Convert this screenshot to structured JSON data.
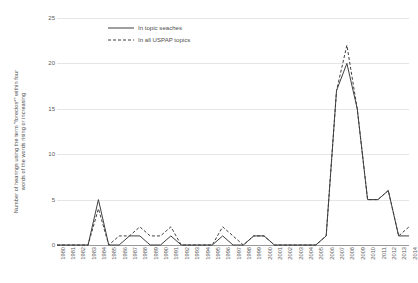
{
  "chart_data": {
    "type": "line",
    "title": "",
    "subtitle": "",
    "xlabel": "",
    "ylabel": "Number of hearings using the term \"foreclos*\" within four words of the words rising or increasing",
    "ylabel_line1": "Number of hearings using the term \"foreclos*\" within four",
    "ylabel_line2": "words of the words rising or increasing",
    "grid": true,
    "legend_position": "top-left-inside",
    "xlim": [
      1980,
      2014
    ],
    "ylim": [
      0,
      25
    ],
    "yticks": [
      0,
      5,
      10,
      15,
      20,
      25
    ],
    "ytick_labels": [
      "0",
      "5",
      "10",
      "15",
      "20",
      "25"
    ],
    "categories": [
      "1980",
      "1981",
      "1982",
      "1983",
      "1984",
      "1985",
      "1986",
      "1987",
      "1988",
      "1989",
      "1990",
      "1991",
      "1992",
      "1993",
      "1994",
      "1995",
      "1996",
      "1997",
      "1998",
      "1999",
      "2000",
      "2001",
      "2002",
      "2003",
      "2004",
      "2005",
      "2006",
      "2007",
      "2008",
      "2009",
      "2010",
      "2011",
      "2012",
      "2013",
      "2014"
    ],
    "series": [
      {
        "name": "In topic seaches",
        "style": "solid",
        "values": [
          0,
          0,
          0,
          0,
          5,
          0,
          0,
          1,
          1,
          0,
          0,
          1,
          0,
          0,
          0,
          0,
          1,
          0,
          0,
          1,
          1,
          0,
          0,
          0,
          0,
          0,
          1,
          17,
          20,
          15,
          5,
          5,
          6,
          1,
          1
        ]
      },
      {
        "name": "In all USPAP topics",
        "style": "dashed",
        "values": [
          0,
          0,
          0,
          0,
          4,
          0,
          1,
          1,
          2,
          1,
          1,
          2,
          0,
          0,
          0,
          0,
          2,
          1,
          0,
          1,
          1,
          0,
          0,
          0,
          0,
          0,
          1,
          17,
          22,
          15,
          5,
          5,
          6,
          1,
          2
        ]
      }
    ],
    "colors": {
      "line": "#3f3f3f",
      "gridline": "#e6e6e6",
      "axis": "#9a9a9a",
      "text": "#5a5a5a",
      "background": "#ffffff"
    }
  },
  "legend": {
    "items": [
      {
        "label": "In topic seaches",
        "style": "solid"
      },
      {
        "label": "In all USPAP topics",
        "style": "dashed"
      }
    ]
  }
}
